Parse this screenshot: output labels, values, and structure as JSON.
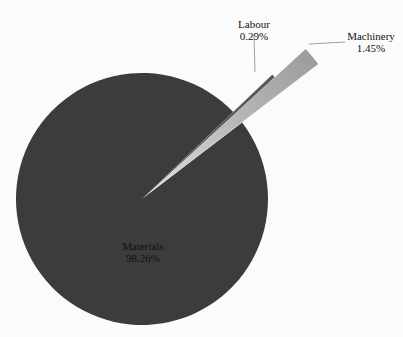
{
  "chart_data": {
    "type": "pie",
    "title": "",
    "categories": [
      "Materials",
      "Machinery",
      "Labour"
    ],
    "values": [
      98.26,
      1.45,
      0.29
    ],
    "unit": "%",
    "labels": [
      {
        "name": "Materials",
        "value_text": "98.26%"
      },
      {
        "name": "Machinery",
        "value_text": "1.45%"
      },
      {
        "name": "Labour",
        "value_text": "0.29%"
      }
    ],
    "colors": {
      "Materials": "#3c3c3c",
      "Machinery": "#9a9a9a",
      "Labour": "#555555"
    },
    "exploded": [
      "Machinery",
      "Labour"
    ],
    "legend": "none",
    "grid": false
  },
  "labels": {
    "materials": {
      "name": "Materials",
      "value": "98.26%"
    },
    "labour": {
      "name": "Labour",
      "value": "0.29%"
    },
    "machinery": {
      "name": "Machinery",
      "value": "1.45%"
    }
  }
}
